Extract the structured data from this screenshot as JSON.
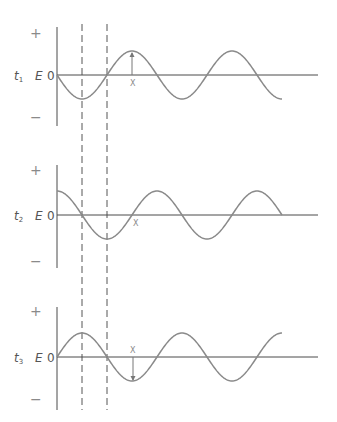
{
  "figure": {
    "title": "",
    "colors": {
      "axis": "#4a4a4a",
      "wave": "#8a8a8a",
      "dashed": "#555555",
      "label": "#555555"
    },
    "dashed_lines": {
      "x": [
        82,
        107
      ],
      "y_top": 24,
      "y_bottom": 410
    },
    "panels": [
      {
        "id": "t1",
        "time_label": "t",
        "time_subscript": "1",
        "axis_label": "E",
        "zero_label": "0",
        "plus_label": "+",
        "minus_label": "−",
        "marker_label": "X",
        "baseline_y": 75,
        "axis_top": 27,
        "axis_bottom": 126,
        "wave_phase": "starts-zero-descending",
        "wave_end_x": 282,
        "marker_x": 132,
        "marker_direction": "up"
      },
      {
        "id": "t2",
        "time_label": "t",
        "time_subscript": "2",
        "axis_label": "E",
        "zero_label": "0",
        "plus_label": "+",
        "minus_label": "−",
        "marker_label": "X",
        "baseline_y": 215,
        "axis_top": 165,
        "axis_bottom": 268,
        "wave_phase": "starts-at-peak",
        "wave_end_x": 282,
        "marker_x": 133,
        "marker_direction": "none"
      },
      {
        "id": "t3",
        "time_label": "t",
        "time_subscript": "3",
        "axis_label": "E",
        "zero_label": "0",
        "plus_label": "+",
        "minus_label": "−",
        "marker_label": "X",
        "baseline_y": 357,
        "axis_top": 307,
        "axis_bottom": 410,
        "wave_phase": "starts-zero-ascending",
        "wave_end_x": 282,
        "marker_x": 133,
        "marker_direction": "down"
      }
    ],
    "wave": {
      "start_x": 57,
      "period_px": 100,
      "amplitude_px": 24,
      "axis_end_x": 318
    }
  }
}
